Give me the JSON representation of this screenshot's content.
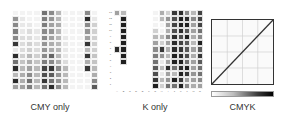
{
  "panels": [
    {
      "id": "cmy",
      "caption": "CMY only"
    },
    {
      "id": "k",
      "caption": "K only"
    },
    {
      "id": "cmyk",
      "caption": "CMYK"
    }
  ],
  "colors": {
    "background": "#ffffff",
    "curve": "#333333",
    "grid_line": "#cccccc"
  },
  "chart_data": [
    {
      "type": "heatmap",
      "title": "CMY only",
      "rows": 13,
      "cols": 12,
      "values": [
        [
          0.05,
          0.05,
          0.05,
          0.05,
          0.6,
          0.5,
          0.3,
          0.05,
          0.05,
          0.05,
          0.5,
          0.05
        ],
        [
          0.45,
          0.1,
          0.05,
          0.05,
          0.55,
          0.45,
          0.3,
          0.05,
          0.05,
          0.05,
          0.9,
          0.1
        ],
        [
          0.5,
          0.1,
          0.1,
          0.05,
          0.55,
          0.4,
          0.35,
          0.05,
          0.05,
          0.05,
          0.5,
          0.2
        ],
        [
          0.55,
          0.1,
          0.15,
          0.1,
          0.5,
          0.45,
          0.3,
          0.05,
          0.05,
          0.05,
          0.45,
          0.2
        ],
        [
          0.5,
          0.15,
          0.15,
          0.1,
          0.5,
          0.4,
          0.3,
          0.1,
          0.05,
          0.05,
          0.4,
          0.2
        ],
        [
          0.85,
          0.15,
          0.2,
          0.15,
          0.45,
          0.35,
          0.3,
          0.1,
          0.05,
          0.05,
          0.85,
          0.2
        ],
        [
          0.1,
          0.15,
          0.2,
          0.15,
          0.45,
          0.35,
          0.3,
          0.1,
          0.05,
          0.05,
          0.3,
          0.2
        ],
        [
          0.9,
          0.2,
          0.3,
          0.2,
          0.5,
          0.65,
          0.3,
          0.1,
          0.05,
          0.05,
          0.85,
          0.25
        ],
        [
          0.6,
          0.25,
          0.35,
          0.25,
          0.55,
          0.5,
          0.35,
          0.15,
          0.05,
          0.05,
          0.35,
          0.25
        ],
        [
          0.9,
          0.3,
          0.4,
          0.3,
          0.8,
          0.85,
          0.5,
          0.3,
          0.05,
          0.05,
          0.85,
          0.3
        ],
        [
          0.3,
          0.35,
          0.5,
          0.3,
          0.75,
          0.7,
          0.45,
          0.3,
          0.05,
          0.05,
          0.05,
          0.35
        ],
        [
          0.9,
          0.35,
          0.6,
          0.3,
          0.85,
          0.6,
          0.45,
          0.3,
          0.05,
          0.05,
          0.05,
          0.5
        ],
        [
          0.4,
          0.4,
          0.55,
          0.3,
          0.6,
          0.9,
          0.5,
          0.3,
          0.05,
          0.05,
          0.05,
          0.7
        ]
      ]
    },
    {
      "type": "heatmap",
      "title": "K only",
      "x_tick_labels": [
        "A",
        "B",
        "C",
        "D",
        "E",
        "F",
        "G",
        "H",
        "I",
        "J",
        "K",
        "L",
        "M",
        "N"
      ],
      "y_tick_labels": [
        "13",
        "12",
        "11",
        "10",
        "9",
        "8",
        "7",
        "6",
        "5",
        "4",
        "3",
        "2",
        "1"
      ],
      "rows": 13,
      "cols": 14,
      "values": [
        [
          0.4,
          0.3,
          0,
          0,
          0,
          0,
          0.05,
          0.35,
          0.2,
          0.85,
          0.9,
          0.5,
          0.3,
          0.8
        ],
        [
          0,
          0.95,
          0,
          0,
          0,
          0,
          0.05,
          0.3,
          0.45,
          0.75,
          0.95,
          0.9,
          0.5,
          0.8
        ],
        [
          0,
          0.95,
          0,
          0,
          0,
          0,
          0.05,
          0.05,
          0.4,
          0.8,
          0.95,
          0.95,
          0.4,
          0.8
        ],
        [
          0,
          0.95,
          0,
          0,
          0,
          0,
          0.2,
          0.05,
          0.35,
          0.75,
          0.9,
          0.7,
          0.4,
          0.6
        ],
        [
          0,
          0.95,
          0,
          0,
          0,
          0,
          0.3,
          0.3,
          0.5,
          0.9,
          0.75,
          0.95,
          0.35,
          0.5
        ],
        [
          0,
          0.95,
          0,
          0,
          0,
          0,
          0.4,
          0.2,
          0.4,
          0.9,
          0.8,
          0.7,
          0.3,
          0.95
        ],
        [
          0.9,
          0.95,
          0,
          0,
          0,
          0,
          0.5,
          0.85,
          0.35,
          0.9,
          0.85,
          0.7,
          0.4,
          0.7
        ],
        [
          0,
          0.95,
          0,
          0,
          0,
          0,
          0.55,
          0.45,
          0.3,
          0.95,
          0.9,
          0.75,
          0.35,
          0.85
        ],
        [
          0,
          0.95,
          0,
          0,
          0,
          0,
          0.6,
          0.1,
          0.4,
          0.95,
          0.95,
          0.6,
          0.4,
          0.7
        ],
        [
          0,
          0,
          0,
          0,
          0,
          0,
          0.7,
          0.3,
          0.9,
          0.6,
          0.9,
          0.95,
          0.4,
          0.6
        ],
        [
          0,
          0,
          0,
          0,
          0,
          0,
          0.75,
          0.1,
          0.4,
          0.3,
          0.95,
          0.85,
          0.45,
          0.6
        ],
        [
          0,
          0,
          0,
          0,
          0,
          0,
          0.85,
          0.3,
          0.45,
          0.95,
          0.85,
          0.4,
          0.4,
          0.5
        ],
        [
          0,
          0,
          0,
          0,
          0,
          0,
          0.95,
          0.2,
          0.6,
          0.6,
          0.95,
          0.5,
          0.35,
          0.4
        ]
      ]
    },
    {
      "type": "line",
      "title": "CMYK",
      "x": [
        0,
        100
      ],
      "y": [
        0,
        100
      ],
      "xlim": [
        0,
        100
      ],
      "ylim": [
        0,
        100
      ],
      "grid": true,
      "grid_divisions": 4,
      "colorbar": "white-to-black gradient"
    }
  ]
}
